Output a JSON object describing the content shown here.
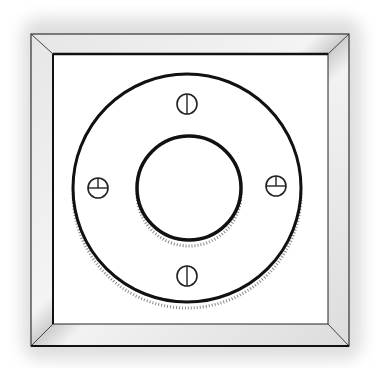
{
  "illustration": {
    "subject": "square-frame-with-circular-flange-plate",
    "screw_count": 4,
    "colors": {
      "background": "#ffffff",
      "shadow": "#d8d8d8",
      "frame_light": "#eeeeee",
      "frame_mid": "#cfcfcf",
      "ink": "#111111"
    }
  }
}
